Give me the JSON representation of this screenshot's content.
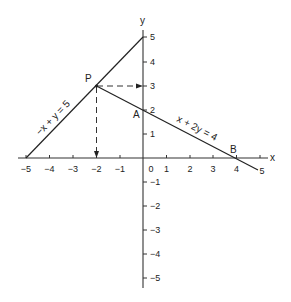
{
  "diagram": {
    "axes": {
      "x_label": "x",
      "y_label": "y",
      "x_ticks": [
        "−5",
        "−4",
        "−3",
        "−2",
        "−1",
        "0",
        "1",
        "2",
        "3",
        "4",
        "5"
      ],
      "y_ticks_pos": [
        "1",
        "2",
        "3",
        "4",
        "5"
      ],
      "y_ticks_neg": [
        "−1",
        "−2",
        "−3",
        "−4",
        "−5"
      ]
    },
    "lines": [
      {
        "label": "−x + y = 5",
        "from": [
          -5,
          0
        ],
        "to": [
          0,
          5
        ]
      },
      {
        "label": "x + 2y = 4",
        "from": [
          -2,
          3
        ],
        "to": [
          5,
          -0.5
        ]
      }
    ],
    "points": {
      "P": {
        "label": "P",
        "coords": [
          -2,
          3
        ]
      },
      "A": {
        "label": "A",
        "coords": [
          0,
          2
        ]
      },
      "B": {
        "label": "B",
        "coords": [
          4,
          0
        ]
      }
    },
    "projections": [
      {
        "from": "P",
        "to_axis": "y",
        "at": 3,
        "style": "dashed-arrow"
      },
      {
        "from": "P",
        "to_axis": "x",
        "at": -2,
        "style": "dashed-arrow"
      }
    ]
  }
}
